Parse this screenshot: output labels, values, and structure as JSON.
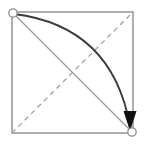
{
  "figure": {
    "background_color": "#ffffff",
    "width": 144,
    "height": 147
  },
  "colors": {
    "square_stroke": "#8c8c8c",
    "diagonal_stroke": "#9a9a9a",
    "dashed_stroke": "#a0a0a0",
    "arc_stroke": "#3a3a3a",
    "arrow_fill": "#111111",
    "vertex_stroke": "#8c8c8c",
    "vertex_fill": "#ffffff"
  },
  "geometry": {
    "square": {
      "name": "bounding-square",
      "left": 12,
      "top": 12,
      "right": 133,
      "bottom": 133,
      "stroke_width": 1.4
    },
    "diagonal": {
      "name": "main-diagonal",
      "from": [
        12,
        12
      ],
      "to": [
        133,
        133
      ],
      "style": "solid",
      "stroke_width": 1.2
    },
    "anti_diagonal": {
      "name": "anti-diagonal",
      "from": [
        12,
        133
      ],
      "to": [
        133,
        12
      ],
      "style": "dashed",
      "dash_pattern": "5,4",
      "stroke_width": 1.3
    },
    "arc": {
      "name": "curved-path",
      "from": [
        14,
        14
      ],
      "to": [
        130,
        126
      ],
      "control": [
        112,
        26
      ],
      "style": "solid",
      "stroke_width": 1.8,
      "direction": "top-left-to-bottom-right"
    },
    "arrowhead": {
      "name": "arrowhead",
      "tip": [
        130,
        131
      ],
      "width": 13,
      "length": 20,
      "points_toward": "down"
    },
    "vertices": [
      {
        "name": "vertex-top-left",
        "cx": 13,
        "cy": 13,
        "r": 4.2
      },
      {
        "name": "vertex-bottom-right",
        "cx": 132,
        "cy": 132,
        "r": 4.2
      }
    ]
  }
}
